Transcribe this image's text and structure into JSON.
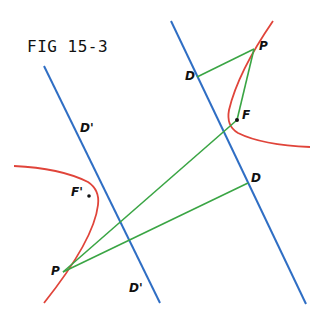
{
  "figure": {
    "title": "FIG 15-3",
    "colors": {
      "directrix": "#2f6ec4",
      "hyperbola": "#e0443a",
      "segment": "#3aa544",
      "ink": "#111111"
    },
    "labels": {
      "d_prime_top": "D'",
      "d_prime_bottom": "D'",
      "d_top": "D",
      "d_bottom": "D",
      "p_right": "P",
      "p_left": "P",
      "f": "F",
      "f_prime": "F'"
    }
  }
}
